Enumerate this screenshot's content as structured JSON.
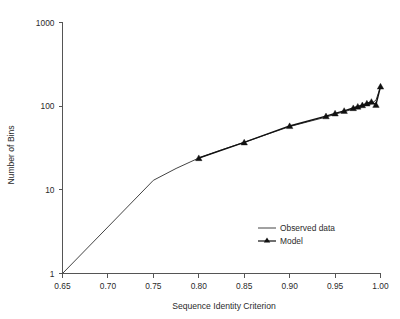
{
  "chart_data": {
    "type": "line",
    "title": "",
    "xlabel": "Sequence Identity Criterion",
    "ylabel": "Number of Bins",
    "xlim": [
      0.65,
      1.0
    ],
    "ylim": [
      1,
      1000
    ],
    "yscale": "log",
    "xticks": [
      "0.65",
      "0.70",
      "0.75",
      "0.80",
      "0.85",
      "0.90",
      "0.95",
      "1.00"
    ],
    "xtick_values": [
      0.65,
      0.7,
      0.75,
      0.8,
      0.85,
      0.9,
      0.95,
      1.0
    ],
    "yticks": [
      "1",
      "10",
      "100",
      "1000"
    ],
    "ytick_values": [
      1,
      10,
      100,
      1000
    ],
    "grid": false,
    "legend_position": "inside-lower-right",
    "series": [
      {
        "name": "Observed data",
        "marker": "none",
        "x": [
          0.65,
          0.7,
          0.75,
          0.775,
          0.8,
          0.825,
          0.85,
          0.875,
          0.9,
          0.92,
          0.94,
          0.95,
          0.96,
          0.97,
          0.975,
          0.98,
          0.985,
          0.99,
          0.995,
          1.0
        ],
        "y": [
          1.0,
          3.6,
          13.0,
          18.0,
          24.0,
          30.0,
          37.0,
          46.0,
          57.0,
          65.0,
          74.0,
          80.0,
          86.0,
          92.0,
          96.0,
          99.0,
          103.0,
          107.0,
          118.0,
          170.0
        ]
      },
      {
        "name": "Model",
        "marker": "triangle",
        "x": [
          0.8,
          0.85,
          0.9,
          0.94,
          0.95,
          0.96,
          0.97,
          0.975,
          0.98,
          0.985,
          0.99,
          0.995,
          1.0
        ],
        "y": [
          24.0,
          37.0,
          58.0,
          76.0,
          82.0,
          88.0,
          95.0,
          99.0,
          103.0,
          108.0,
          113.0,
          104.0,
          172.0
        ]
      }
    ],
    "legend": [
      {
        "label": "Observed data",
        "style": "line",
        "color": "#444444"
      },
      {
        "label": "Model",
        "style": "line-marker",
        "color": "#111111"
      }
    ]
  },
  "colors": {
    "observed": "#444444",
    "model": "#111111",
    "axis": "#555555",
    "text": "#2b2b2b",
    "background": "#ffffff"
  }
}
